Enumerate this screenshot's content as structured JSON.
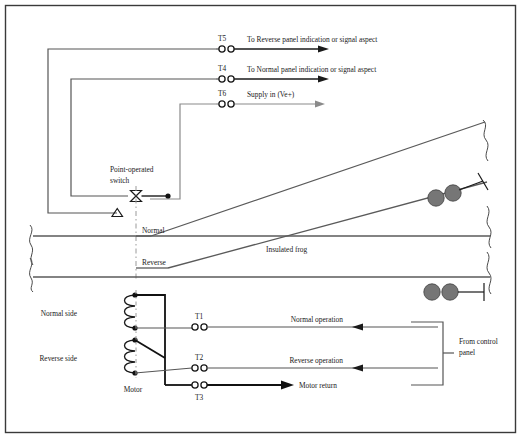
{
  "figure": {
    "border_color": "#3a3a3a",
    "background": "#ffffff",
    "wire_dark": "#111111",
    "wire_gray": "#6e6e6e",
    "rail_color": "#5a5a5a",
    "joint_fill": "#767676",
    "width": 521,
    "height": 438
  },
  "terminals": {
    "t5": {
      "label": "T5",
      "x": 222,
      "y": 49,
      "desc": "To Reverse panel indication or signal aspect"
    },
    "t4": {
      "label": "T4",
      "x": 222,
      "y": 79,
      "desc": "To Normal panel indication or signal aspect"
    },
    "t6": {
      "label": "T6",
      "x": 222,
      "y": 104,
      "desc": "Supply in (Ve+)"
    },
    "t1": {
      "label": "T1",
      "x": 198,
      "y": 327,
      "desc": "Normal operation"
    },
    "t2": {
      "label": "T2",
      "x": 198,
      "y": 368,
      "desc": "Reverse operation"
    },
    "t3": {
      "label": "T3",
      "x": 198,
      "y": 385,
      "desc": "Motor return"
    }
  },
  "labels": {
    "to_reverse_panel": "To Reverse panel indication or signal aspect",
    "to_normal_panel": "To Normal panel indication or signal aspect",
    "supply_in": "Supply in (Ve+)",
    "point_operated_switch_l1": "Point-operated",
    "point_operated_switch_l2": "switch",
    "normal": "Normal",
    "reverse": "Reverse",
    "insulated_frog": "Insulated frog",
    "normal_side": "Normal side",
    "reverse_side": "Reverse side",
    "motor": "Motor",
    "normal_operation": "Normal operation",
    "reverse_operation": "Reverse operation",
    "motor_return": "Motor return",
    "from_control_panel_l1": "From control",
    "from_control_panel_l2": "panel",
    "t5": "T5",
    "t4": "T4",
    "t6": "T6",
    "t1": "T1",
    "t2": "T2",
    "t3": "T3"
  }
}
